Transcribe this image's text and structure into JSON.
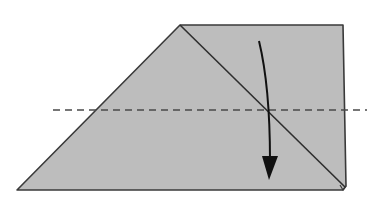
{
  "diagram": {
    "type": "origami-fold-step",
    "colors": {
      "background": "#ffffff",
      "paper_fill": "#bdbdbd",
      "outline": "#3a3a3a",
      "dashed_line": "#4a4a4a",
      "arrow": "#111111"
    },
    "paper": {
      "shape": "trapezoid",
      "points": [
        [
          180,
          25
        ],
        [
          343,
          25
        ],
        [
          345,
          186
        ],
        [
          343,
          190
        ],
        [
          17,
          190
        ]
      ]
    },
    "crease_line": {
      "from": [
        180,
        25
      ],
      "to": [
        345,
        188
      ]
    },
    "fold_line": {
      "style": "dashed",
      "y": 110,
      "x_start": 53,
      "x_end": 367
    },
    "arrow": {
      "direction": "down",
      "start": [
        259,
        40
      ],
      "end": [
        268,
        178
      ]
    }
  }
}
